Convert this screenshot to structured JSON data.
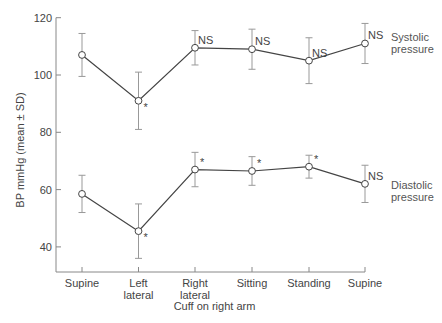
{
  "chart_data": {
    "type": "line",
    "title": "",
    "xlabel": "Cuff on right arm",
    "ylabel": "BP mmHg (mean ± SD)",
    "ylim": [
      30,
      120
    ],
    "yticks": [
      40,
      60,
      80,
      100,
      120
    ],
    "grid": false,
    "categories": [
      "Supine",
      "Left lateral",
      "Right lateral",
      "Sitting",
      "Standing",
      "Supine"
    ],
    "category_lines": [
      [
        "Supine"
      ],
      [
        "Left",
        "lateral"
      ],
      [
        "Right",
        "lateral"
      ],
      [
        "Sitting"
      ],
      [
        "Standing"
      ],
      [
        "Supine"
      ]
    ],
    "series": [
      {
        "name": "Systolic pressure",
        "label_lines": [
          "Systolic",
          "pressure"
        ],
        "values": [
          107,
          91,
          109.5,
          109,
          105,
          111
        ],
        "sd": [
          7.5,
          10,
          6,
          7,
          8,
          7
        ],
        "annotations": [
          "",
          "*",
          "NS",
          "NS",
          "NS",
          "NS"
        ]
      },
      {
        "name": "Diastolic pressure",
        "label_lines": [
          "Diastolic",
          "pressure"
        ],
        "values": [
          58.5,
          45.5,
          67,
          66.5,
          68,
          62
        ],
        "sd": [
          6.5,
          9.5,
          6,
          5,
          4,
          6.5
        ],
        "annotations": [
          "",
          "*",
          "*",
          "*",
          "*",
          "NS"
        ]
      }
    ]
  }
}
